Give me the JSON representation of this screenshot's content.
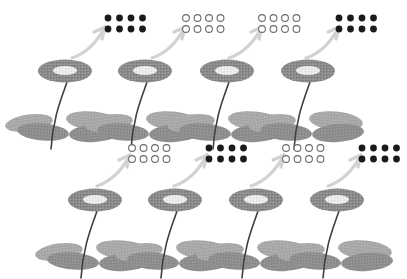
{
  "figure": {
    "title": "Flowering plants with seed-count groups",
    "background_color": "#ffffff",
    "width": 407,
    "height": 279
  },
  "palette": {
    "flower_head_ring": "#8c8c8c",
    "flower_head_center": "#ededed",
    "stem": "#3f3f3f",
    "leaf_light": "#a8a8a8",
    "leaf_dark": "#8f8f8f",
    "arrow": "#d2d2d2",
    "dot_filled": "#1a1a1a",
    "dot_open_stroke": "#6b6b6b",
    "dot_open_fill": "#ffffff"
  },
  "legend": {
    "filled_dot_label": "filled dot",
    "open_dot_label": "open dot",
    "arrow_label": "produces"
  },
  "rows": [
    {
      "row_label": "row-1",
      "plants": [
        {
          "plant_label": "plant-1",
          "flower_label": "flower-head",
          "stem_label": "stem",
          "leaves_count": 3,
          "dot_group": {
            "group_label": "seed-group-1",
            "fill_state": "filled",
            "columns": 4,
            "rows": 2,
            "count": 8,
            "count_text": "8"
          }
        },
        {
          "plant_label": "plant-2",
          "flower_label": "flower-head",
          "stem_label": "stem",
          "leaves_count": 3,
          "dot_group": {
            "group_label": "seed-group-2",
            "fill_state": "open",
            "columns": 4,
            "rows": 2,
            "count": 8,
            "count_text": "8"
          }
        },
        {
          "plant_label": "plant-3",
          "flower_label": "flower-head",
          "stem_label": "stem",
          "leaves_count": 3,
          "dot_group": {
            "group_label": "seed-group-3",
            "fill_state": "open",
            "columns": 4,
            "rows": 2,
            "count": 8,
            "count_text": "8"
          }
        },
        {
          "plant_label": "plant-4",
          "flower_label": "flower-head",
          "stem_label": "stem",
          "leaves_count": 3,
          "dot_group": {
            "group_label": "seed-group-4",
            "fill_state": "filled",
            "columns": 4,
            "rows": 2,
            "count": 8,
            "count_text": "8"
          }
        }
      ]
    },
    {
      "row_label": "row-2",
      "plants": [
        {
          "plant_label": "plant-5",
          "flower_label": "flower-head",
          "stem_label": "stem",
          "leaves_count": 3,
          "dot_group": {
            "group_label": "seed-group-5",
            "fill_state": "open",
            "columns": 4,
            "rows": 2,
            "count": 8,
            "count_text": "8"
          }
        },
        {
          "plant_label": "plant-6",
          "flower_label": "flower-head",
          "stem_label": "stem",
          "leaves_count": 3,
          "dot_group": {
            "group_label": "seed-group-6",
            "fill_state": "filled",
            "columns": 4,
            "rows": 2,
            "count": 8,
            "count_text": "8"
          }
        },
        {
          "plant_label": "plant-7",
          "flower_label": "flower-head",
          "stem_label": "stem",
          "leaves_count": 3,
          "dot_group": {
            "group_label": "seed-group-7",
            "fill_state": "open",
            "columns": 4,
            "rows": 2,
            "count": 8,
            "count_text": "8"
          }
        },
        {
          "plant_label": "plant-8",
          "flower_label": "flower-head",
          "stem_label": "stem",
          "leaves_count": 3,
          "dot_group": {
            "group_label": "seed-group-8",
            "fill_state": "filled",
            "columns": 4,
            "rows": 2,
            "count": 8,
            "count_text": "8"
          }
        }
      ]
    }
  ],
  "geometry": {
    "row_origins_y": [
      0,
      132
    ],
    "plant_x": [
      65,
      145,
      227,
      308
    ],
    "plant_row2_x_offset": 22,
    "flower_head_y": 71,
    "flower_rx": 27,
    "flower_ry": 11.5,
    "flower_center_rx": 12,
    "flower_center_ry": 4.5,
    "dot_radius": 3.4,
    "dot_spacing_x": 11.5,
    "dot_spacing_y": 11,
    "dot_group_y": 18,
    "dot_group_x": [
      108,
      186,
      262,
      339
    ]
  }
}
